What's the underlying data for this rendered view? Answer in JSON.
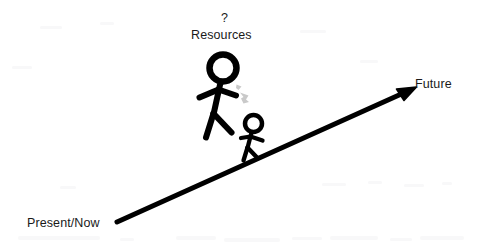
{
  "diagram": {
    "title_visible": false,
    "background_color": "#ffffff",
    "ink_color": "#000000",
    "hint_arrow_color": "#c9c9c9",
    "width": 478,
    "height": 249,
    "labels": {
      "present": "Present/Now",
      "future": "Future",
      "question": "?",
      "resources": "Resources"
    },
    "timeline_arrow": {
      "name": "timeline-arrow",
      "from": "Present/Now",
      "to": "Future",
      "start_x": 117,
      "start_y": 222,
      "end_x": 415,
      "end_y": 88,
      "stroke_width": 5
    },
    "figures": [
      {
        "name": "large-stick-figure",
        "role": "adult",
        "head_center_x": 223,
        "head_center_y": 68,
        "head_radius": 15,
        "stroke_width": 6
      },
      {
        "name": "small-stick-figure",
        "role": "child",
        "head_center_x": 253,
        "head_center_y": 124,
        "head_radius": 9,
        "stroke_width": 4
      }
    ],
    "hint_arrow": {
      "name": "gray-hint-arrow",
      "from_figure": "large-stick-figure",
      "to_figure": "small-stick-figure",
      "color": "#c9c9c9"
    }
  }
}
